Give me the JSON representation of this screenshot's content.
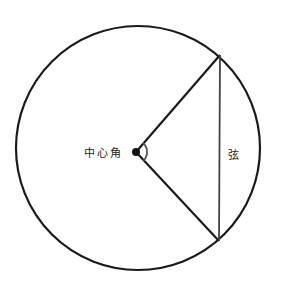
{
  "diagram": {
    "labels": {
      "central_angle": "中心角",
      "chord": "弦"
    },
    "colors": {
      "stroke": "#1a1a1a",
      "chord": "#444444",
      "background": "#ffffff"
    }
  }
}
